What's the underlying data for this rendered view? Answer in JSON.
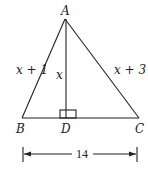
{
  "diagram": {
    "type": "triangle-with-altitude",
    "vertices": {
      "A": {
        "label": "A",
        "x": 65,
        "y": 19
      },
      "B": {
        "label": "B",
        "x": 22,
        "y": 118
      },
      "C": {
        "label": "C",
        "x": 139,
        "y": 118
      },
      "D": {
        "label": "D",
        "x": 66,
        "y": 118
      }
    },
    "segments": {
      "AB": {
        "label": "x + 1"
      },
      "AC": {
        "label": "x + 3"
      },
      "AD": {
        "label": "x"
      },
      "BC": {
        "label": "14"
      }
    },
    "right_angle_at": "D",
    "dimension": {
      "label": "14"
    }
  }
}
